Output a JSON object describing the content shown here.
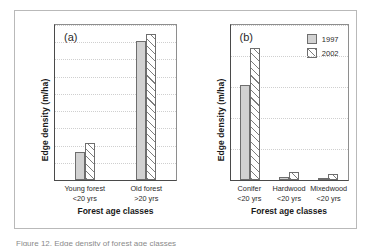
{
  "figure": {
    "caption_partial": "Figure 12. Edge density of forest age classes"
  },
  "legend": {
    "items": [
      {
        "label": "1997",
        "style": "solid-gray",
        "color": "#d2d2d2"
      },
      {
        "label": "2002",
        "style": "diagonal-hatch",
        "color": "#ffffff"
      }
    ]
  },
  "chart_data": [
    {
      "type": "bar",
      "panel": "(a)",
      "title": "",
      "xlabel": "Forest age classes",
      "ylabel": "Edge density (m/ha)",
      "ylim": [
        0,
        9
      ],
      "yticks": [
        0,
        1,
        2,
        3,
        4,
        5,
        6,
        7,
        8,
        9
      ],
      "ytick_labels": [
        "0",
        "1",
        "2",
        "3",
        "4",
        "5",
        "6",
        "7",
        "8",
        "9"
      ],
      "grid": true,
      "legend_position": "none",
      "categories": [
        "Young forest\n<20 yrs",
        "Old forest\n>20 yrs"
      ],
      "category_lines": [
        {
          "line1": "Young forest",
          "line2": "<20 yrs"
        },
        {
          "line1": "Old forest",
          "line2": ">20 yrs"
        }
      ],
      "series": [
        {
          "name": "1997",
          "values": [
            1.62,
            8.1
          ]
        },
        {
          "name": "2002",
          "values": [
            2.15,
            8.5
          ]
        }
      ]
    },
    {
      "type": "bar",
      "panel": "(b)",
      "title": "",
      "xlabel": "Forest age classes",
      "ylabel": "Edge density (m/ha)",
      "ylim": [
        0,
        2.5
      ],
      "yticks": [
        0.0,
        0.5,
        1.0,
        1.5,
        2.0,
        2.5
      ],
      "ytick_labels": [
        "0.0",
        "0.5",
        "1.0",
        "1.5",
        "2.0",
        "2.5"
      ],
      "grid": true,
      "legend_position": "top-right",
      "categories": [
        "Conifer\n<20 yrs",
        "Hardwood\n<20 yrs",
        "Mixedwood\n<20 yrs"
      ],
      "category_lines": [
        {
          "line1": "Conifer",
          "line2": "<20 yrs"
        },
        {
          "line1": "Hardwood",
          "line2": "<20 yrs"
        },
        {
          "line1": "Mixedwood",
          "line2": "<20 yrs"
        }
      ],
      "series": [
        {
          "name": "1997",
          "values": [
            1.53,
            0.05,
            0.01
          ]
        },
        {
          "name": "2002",
          "values": [
            2.13,
            0.13,
            0.09
          ]
        }
      ]
    }
  ]
}
